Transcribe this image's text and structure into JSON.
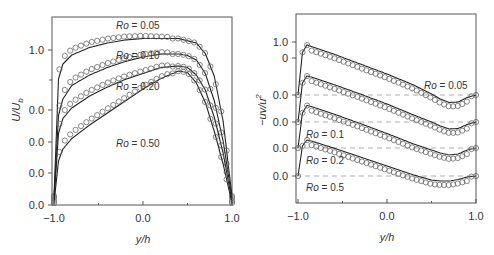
{
  "chart_data": [
    {
      "type": "line",
      "panel": "left",
      "title": "",
      "xlabel": "y/h",
      "ylabel": "U/U_b",
      "ylabel_main": "U/U",
      "ylabel_sub": "b",
      "xlim": [
        -1.0,
        1.0
      ],
      "x_ticks": [
        "-1.0",
        "0.0",
        "1.0"
      ],
      "y_ticks": [
        "1.0",
        "0.0",
        "0.0",
        "0.0",
        "0.0"
      ],
      "grid": false,
      "legend": "none",
      "markers": "open circles = experiment/DNS; solid lines = model",
      "series": [
        {
          "name": "Ro = 0.05",
          "label_text": "Ro = 0.05",
          "x": [
            -1.0,
            -0.95,
            -0.9,
            -0.8,
            -0.6,
            -0.4,
            -0.2,
            0.0,
            0.2,
            0.4,
            0.6,
            0.7,
            0.8,
            0.9,
            0.95,
            1.0
          ],
          "values": [
            0.0,
            0.78,
            0.88,
            0.94,
            0.99,
            1.02,
            1.04,
            1.05,
            1.05,
            1.05,
            1.02,
            0.95,
            0.8,
            0.5,
            0.25,
            0.0
          ]
        },
        {
          "name": "Ro = 0.10",
          "label_text": "Ro = 0.10",
          "x": [
            -1.0,
            -0.95,
            -0.9,
            -0.8,
            -0.6,
            -0.4,
            -0.2,
            0.0,
            0.2,
            0.4,
            0.5,
            0.6,
            0.7,
            0.8,
            0.9,
            1.0
          ],
          "values": [
            0.0,
            0.55,
            0.66,
            0.75,
            0.82,
            0.87,
            0.91,
            0.94,
            0.96,
            0.96,
            0.95,
            0.92,
            0.83,
            0.65,
            0.38,
            0.0
          ]
        },
        {
          "name": "Ro = 0.20",
          "label_text": "Ro = 0.20",
          "x": [
            -1.0,
            -0.95,
            -0.9,
            -0.8,
            -0.6,
            -0.4,
            -0.2,
            0.0,
            0.2,
            0.4,
            0.5,
            0.6,
            0.7,
            0.8,
            0.9,
            1.0
          ],
          "values": [
            0.0,
            0.45,
            0.55,
            0.62,
            0.7,
            0.76,
            0.81,
            0.85,
            0.89,
            0.9,
            0.89,
            0.84,
            0.74,
            0.56,
            0.32,
            0.0
          ]
        },
        {
          "name": "Ro = 0.50",
          "label_text": "Ro = 0.50",
          "x": [
            -1.0,
            -0.95,
            -0.9,
            -0.8,
            -0.6,
            -0.4,
            -0.2,
            0.0,
            0.2,
            0.4,
            0.5,
            0.6,
            0.7,
            0.8,
            0.9,
            1.0
          ],
          "values": [
            0.0,
            0.28,
            0.36,
            0.43,
            0.52,
            0.6,
            0.68,
            0.76,
            0.83,
            0.88,
            0.87,
            0.8,
            0.67,
            0.48,
            0.26,
            0.0
          ]
        }
      ]
    },
    {
      "type": "line",
      "panel": "right",
      "title": "",
      "xlabel": "y/h",
      "ylabel": "-uv/u_τ^2",
      "ylabel_main": "−uv/u",
      "ylabel_sup": "2",
      "xlim": [
        -1.0,
        1.0
      ],
      "x_ticks": [
        "-1.0",
        "0.0",
        "1.0"
      ],
      "y_ticks": [
        "1.0",
        "0",
        "0.0",
        "0.0",
        "0.0",
        "0.0"
      ],
      "grid": false,
      "legend": "none",
      "reference_lines": "dashed zero lines for each offset curve",
      "series": [
        {
          "name": "Ro = 0.05",
          "label_text": "Ro = 0.05",
          "x": [
            -1.0,
            -0.95,
            -0.9,
            -0.85,
            -0.6,
            -0.3,
            0.0,
            0.3,
            0.5,
            0.6,
            0.7,
            0.8,
            0.9,
            1.0
          ],
          "values": [
            0.0,
            0.85,
            1.0,
            0.97,
            0.82,
            0.62,
            0.42,
            0.2,
            0.02,
            -0.08,
            -0.15,
            -0.14,
            -0.05,
            0.0
          ]
        },
        {
          "name": "Ro = 0.1",
          "label_text": "Ro = 0.1",
          "x": [
            -1.0,
            -0.95,
            -0.9,
            -0.85,
            -0.6,
            -0.3,
            0.0,
            0.3,
            0.5,
            0.6,
            0.7,
            0.8,
            0.9,
            1.0
          ],
          "values": [
            0.0,
            0.78,
            0.92,
            0.9,
            0.75,
            0.56,
            0.36,
            0.14,
            0.0,
            -0.08,
            -0.14,
            -0.13,
            -0.05,
            0.0
          ]
        },
        {
          "name": "Ro = 0.2",
          "label_text": "Ro = 0.2",
          "x": [
            -1.0,
            -0.95,
            -0.9,
            -0.85,
            -0.6,
            -0.3,
            0.0,
            0.3,
            0.5,
            0.6,
            0.7,
            0.8,
            0.9,
            1.0
          ],
          "values": [
            0.0,
            0.7,
            0.85,
            0.83,
            0.68,
            0.49,
            0.29,
            0.08,
            -0.04,
            -0.1,
            -0.14,
            -0.12,
            -0.04,
            0.0
          ]
        },
        {
          "name": "Ro = 0.5",
          "label_text": "Ro = 0.5",
          "x": [
            -1.0,
            -0.95,
            -0.9,
            -0.85,
            -0.6,
            -0.3,
            0.0,
            0.3,
            0.5,
            0.6,
            0.7,
            0.8,
            0.9,
            1.0
          ],
          "values": [
            0.0,
            0.6,
            0.72,
            0.7,
            0.56,
            0.38,
            0.2,
            0.02,
            -0.08,
            -0.1,
            -0.1,
            -0.07,
            -0.02,
            0.0
          ]
        }
      ]
    }
  ]
}
